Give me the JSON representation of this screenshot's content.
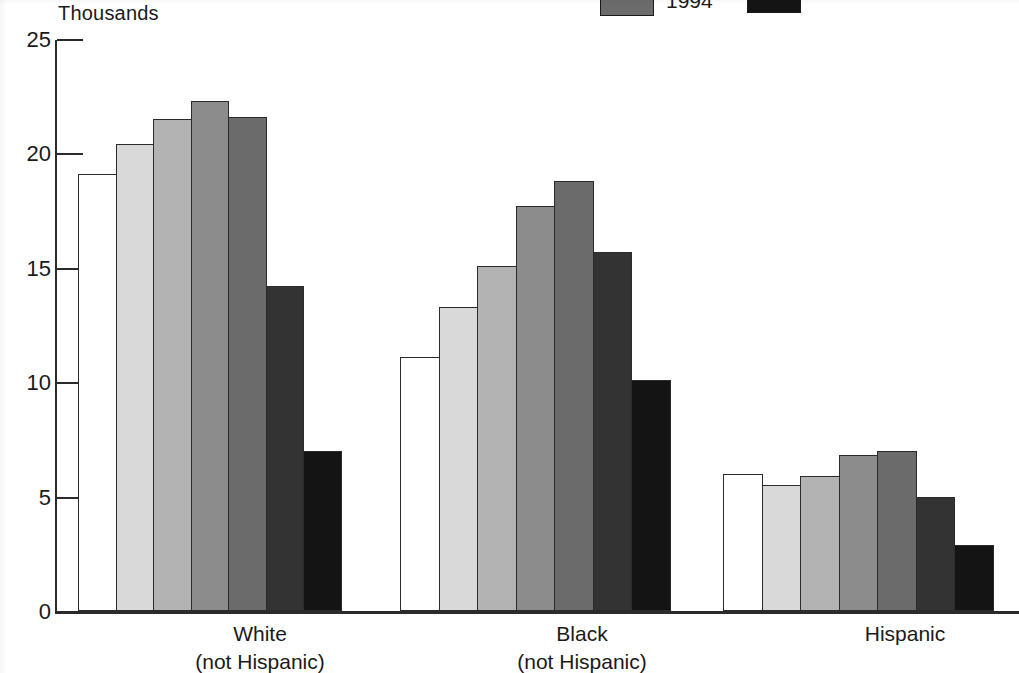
{
  "axis_unit_label": "Thousands",
  "legend": {
    "entries": [
      {
        "label": "1994",
        "swatch_color": "#6b6b6b",
        "clipped": false
      },
      {
        "label": "",
        "swatch_color": "#141414",
        "clipped": true
      }
    ]
  },
  "colors": {
    "axis": "#2b2b2b",
    "bar_outline": "#2b2b2b",
    "series": [
      "#ffffff",
      "#d9d9d9",
      "#b3b3b3",
      "#8c8c8c",
      "#6b6b6b",
      "#333333",
      "#141414"
    ]
  },
  "chart_data": {
    "type": "bar",
    "title": "",
    "xlabel": "",
    "ylabel": "Thousands",
    "ylim": [
      0,
      25
    ],
    "yticks": [
      0,
      5,
      10,
      15,
      20,
      25
    ],
    "ytick_labels": [
      "0",
      "5",
      "10",
      "15",
      "20",
      "25"
    ],
    "grid": false,
    "legend_position": "top-right",
    "legend_entries": [
      "1994"
    ],
    "categories": [
      "White\n(not Hispanic)",
      "Black\n(not Hispanic)",
      "Hispanic"
    ],
    "category_labels": [
      {
        "line1": "White",
        "line2": "(not Hispanic)"
      },
      {
        "line1": "Black",
        "line2": "(not Hispanic)"
      },
      {
        "line1": "Hispanic",
        "line2": ""
      }
    ],
    "series": [
      {
        "name": "series-1",
        "shade": "#ffffff",
        "values": [
          19.1,
          11.1,
          6.0
        ]
      },
      {
        "name": "series-2",
        "shade": "#d9d9d9",
        "values": [
          20.4,
          13.3,
          5.5
        ]
      },
      {
        "name": "series-3",
        "shade": "#b3b3b3",
        "values": [
          21.5,
          15.1,
          5.9
        ]
      },
      {
        "name": "series-4",
        "shade": "#8c8c8c",
        "values": [
          22.3,
          17.7,
          6.8
        ]
      },
      {
        "name": "series-5",
        "shade": "#6b6b6b",
        "values": [
          21.6,
          18.8,
          7.0
        ]
      },
      {
        "name": "series-6",
        "shade": "#333333",
        "values": [
          14.2,
          15.7,
          5.0
        ]
      },
      {
        "name": "series-7",
        "shade": "#141414",
        "values": [
          7.0,
          10.1,
          2.9
        ]
      }
    ]
  }
}
